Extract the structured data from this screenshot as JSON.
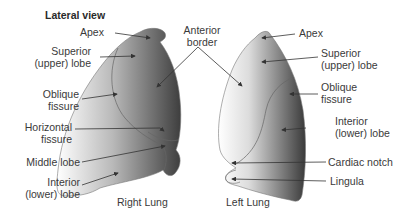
{
  "title": "Lateral view",
  "right_lung": {
    "caption": "Right Lung",
    "labels": {
      "apex": "Apex",
      "superior_1": "Superior",
      "superior_2": "(upper) lobe",
      "oblique_1": "Oblique",
      "oblique_2": "fissure",
      "horizontal_1": "Horizontal",
      "horizontal_2": "fissure",
      "middle": "Middle lobe",
      "inferior_1": "Interior",
      "inferior_2": "(lower) lobe"
    }
  },
  "shared": {
    "anterior_1": "Anterior",
    "anterior_2": "border"
  },
  "left_lung": {
    "caption": "Left Lung",
    "labels": {
      "apex": "Apex",
      "superior_1": "Superior",
      "superior_2": "(upper) lobe",
      "oblique_1": "Oblique",
      "oblique_2": "fissure",
      "inferior_1": "Interior",
      "inferior_2": "(lower) lobe",
      "cardiac": "Cardiac notch",
      "lingula": "Lingula"
    }
  },
  "colors": {
    "lung_dark": "#4a4a4a",
    "lung_light": "#ffffff",
    "text": "#3a3a3a"
  }
}
